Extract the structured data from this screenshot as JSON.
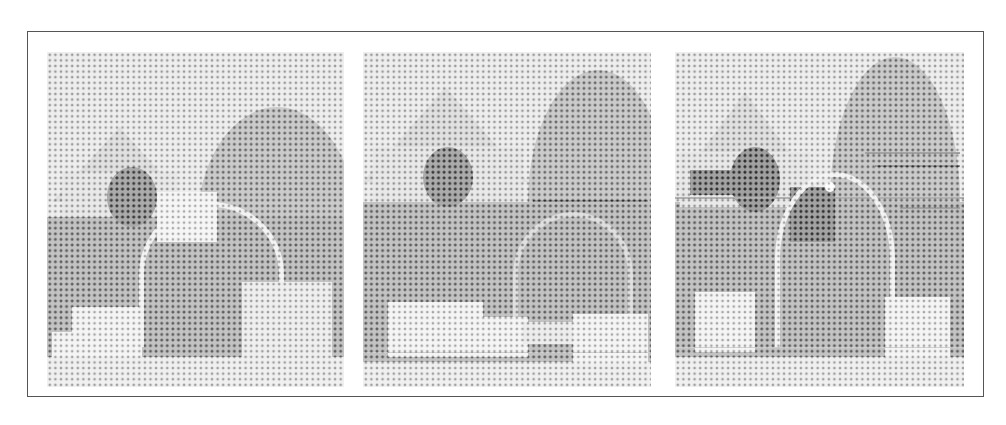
{
  "figure": {
    "panel_count": 3,
    "rendering": "halftone dot screen, grayscale",
    "border_color": "#555555",
    "background_color": "#ffffff",
    "panels": [
      {
        "index": 1,
        "scene": "barn with peaked roof at upper-left, large dark hill/tree mass at upper-right, tree by barn, white arch-shaped object in center, light rectangular blocks on ground",
        "highlights": [
          "arch",
          "blocks"
        ]
      },
      {
        "index": 2,
        "scene": "same scene, arch object faint/partially visible, rectangular blocks along bottom of ground",
        "highlights": [
          "blocks"
        ]
      },
      {
        "index": 3,
        "scene": "same scene with strong dark horizontal lines (fence) across right side, arch object prominent at center, blocks at lower-left and lower-right",
        "highlights": [
          "arch",
          "fence-lines",
          "blocks"
        ]
      }
    ]
  }
}
